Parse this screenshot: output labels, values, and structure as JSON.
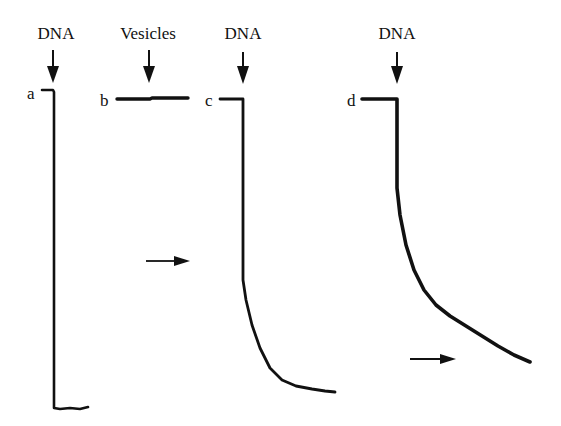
{
  "chart_data": {
    "type": "line",
    "title": "",
    "xlabel": "",
    "ylabel": "",
    "grid": false,
    "legend": null,
    "annotations": [
      {
        "text": "DNA",
        "x": 56,
        "y": 33,
        "arrow_x": 53
      },
      {
        "text": "Vesicles",
        "x": 148,
        "y": 33,
        "arrow_x": 149
      },
      {
        "text": "DNA",
        "x": 243,
        "y": 33,
        "arrow_x": 243
      },
      {
        "text": "DNA",
        "x": 397,
        "y": 33,
        "arrow_x": 397
      }
    ],
    "series": [
      {
        "name": "a",
        "label_pos": [
          27,
          97
        ],
        "points": [
          [
            42,
            90
          ],
          [
            53,
            90
          ],
          [
            54,
            92
          ],
          [
            54,
            408
          ],
          [
            60,
            409
          ],
          [
            70,
            408
          ],
          [
            80,
            409
          ],
          [
            88,
            407
          ]
        ],
        "width": 2.6
      },
      {
        "name": "b",
        "label_pos": [
          100,
          106
        ],
        "points": [
          [
            117,
            99
          ],
          [
            150,
            99
          ],
          [
            152,
            98
          ],
          [
            188,
            98
          ]
        ],
        "width": 3.4
      },
      {
        "name": "c",
        "label_pos": [
          205,
          106
        ],
        "points": [
          [
            220,
            99
          ],
          [
            243,
            99
          ],
          [
            243,
            101
          ],
          [
            243,
            280
          ],
          [
            246,
            300
          ],
          [
            252,
            325
          ],
          [
            260,
            348
          ],
          [
            270,
            368
          ],
          [
            282,
            380
          ],
          [
            296,
            386
          ],
          [
            312,
            389
          ],
          [
            325,
            391
          ],
          [
            335,
            392
          ]
        ],
        "width": 2.8
      },
      {
        "name": "d",
        "label_pos": [
          347,
          106
        ],
        "points": [
          [
            362,
            99
          ],
          [
            397,
            99
          ],
          [
            397,
            101
          ],
          [
            397,
            188
          ],
          [
            400,
            215
          ],
          [
            406,
            245
          ],
          [
            414,
            270
          ],
          [
            424,
            290
          ],
          [
            436,
            305
          ],
          [
            450,
            316
          ],
          [
            466,
            326
          ],
          [
            482,
            336
          ],
          [
            498,
            346
          ],
          [
            514,
            355
          ],
          [
            530,
            362
          ]
        ],
        "width": 3.6
      }
    ],
    "horizontal_arrows": [
      {
        "x1": 146,
        "x2": 190,
        "y": 261
      },
      {
        "x1": 410,
        "x2": 456,
        "y": 359
      }
    ]
  },
  "labels": {
    "top_a": "DNA",
    "top_b": "Vesicles",
    "top_c": "DNA",
    "top_d": "DNA",
    "panel_a": "a",
    "panel_b": "b",
    "panel_c": "c",
    "panel_d": "d"
  }
}
